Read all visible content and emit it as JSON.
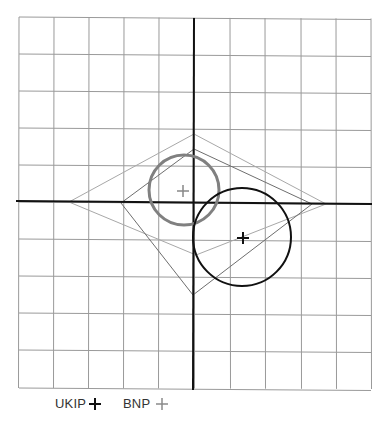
{
  "figure": {
    "type": "political-compass-diagram",
    "grid": {
      "columns": 10,
      "rows": 10,
      "x_lines": [
        19,
        54,
        89,
        124,
        159,
        194,
        230,
        265,
        301,
        336,
        371
      ],
      "y_lines": [
        17,
        54,
        91,
        128,
        165,
        202,
        239,
        276,
        313,
        350,
        388
      ],
      "line_color": "#9a9a9a"
    },
    "axes": {
      "color": "#111111",
      "horizontal": {
        "x1": 16,
        "y1": 201,
        "x2": 372,
        "y2": 204
      },
      "vertical": {
        "x1": 194,
        "y1": 18,
        "x2": 193,
        "y2": 390
      }
    },
    "shapes": [
      {
        "name": "outer-light-diamond",
        "color": "#a8a8a8",
        "points": [
          [
            194,
            134
          ],
          [
            326,
            204
          ],
          [
            196,
            255
          ],
          [
            69,
            202
          ]
        ]
      },
      {
        "name": "inner-dark-quadrilateral",
        "color": "#6e6e6e",
        "points": [
          [
            194,
            149
          ],
          [
            312,
            204
          ],
          [
            193,
            295
          ],
          [
            121,
            203
          ]
        ]
      }
    ],
    "circles": [
      {
        "party": "BNP",
        "cx": 184,
        "cy": 190,
        "r": 35,
        "color": "#808080",
        "width": 3
      },
      {
        "party": "UKIP",
        "cx": 242,
        "cy": 237,
        "r": 49,
        "color": "#111111",
        "width": 2
      }
    ],
    "markers": [
      {
        "party": "BNP",
        "x": 183,
        "y": 191,
        "color": "#888888"
      },
      {
        "party": "UKIP",
        "x": 243,
        "y": 238,
        "color": "#111111"
      }
    ]
  },
  "legend": {
    "items": [
      {
        "label": "UKIP",
        "color": "#111111",
        "marker": "cross-icon"
      },
      {
        "label": "BNP",
        "color": "#8a8a8a",
        "marker": "cross-icon"
      }
    ]
  }
}
